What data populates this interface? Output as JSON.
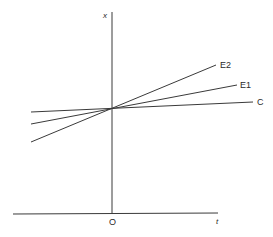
{
  "diagram": {
    "axes": {
      "vertical_label": "x",
      "horizontal_label": "t",
      "origin_label": "O"
    },
    "lines": [
      {
        "id": "C",
        "label": "C",
        "x1": 31,
        "y1": 112,
        "x2": 253,
        "y2": 102
      },
      {
        "id": "E1",
        "label": "E1",
        "x1": 31,
        "y1": 124,
        "x2": 237,
        "y2": 85
      },
      {
        "id": "E2",
        "label": "E2",
        "x1": 31,
        "y1": 142,
        "x2": 216,
        "y2": 65
      }
    ],
    "intersection": {
      "x": 112,
      "y": 110
    },
    "stroke_color": "#3a3a3a"
  }
}
